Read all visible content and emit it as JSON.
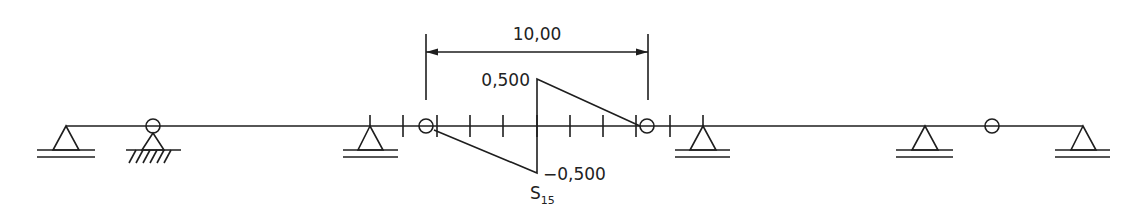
{
  "diagram": {
    "type": "influence-line",
    "dimension": {
      "label": "10,00"
    },
    "ordinates": {
      "top": "0,500",
      "bottom": "−0,500"
    },
    "influence_label": {
      "main": "S",
      "sub": "15"
    },
    "colors": {
      "line": "#1e1e1e",
      "background": "#ffffff"
    }
  }
}
